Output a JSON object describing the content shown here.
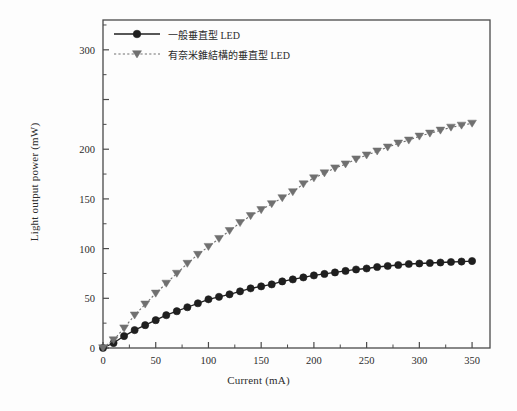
{
  "chart_data": {
    "type": "line",
    "title": "",
    "xlabel": "Current (mA)",
    "ylabel": "Light output power (mW)",
    "xlim": [
      0,
      367
    ],
    "ylim": [
      0,
      330
    ],
    "xticks": [
      0,
      50,
      100,
      150,
      200,
      250,
      300,
      350
    ],
    "xtick_labels": [
      "0",
      "50",
      "100",
      "150",
      "200",
      "250",
      "300",
      "350"
    ],
    "xminor_step": 25,
    "yticks": [
      0,
      50,
      100,
      150,
      200,
      250,
      300
    ],
    "ytick_labels": [
      "0",
      "50",
      "100",
      "150",
      "200",
      "",
      "300"
    ],
    "yminor_step": 25,
    "grid": false,
    "legend_position": "top-left",
    "x": [
      0,
      10,
      20,
      30,
      40,
      50,
      60,
      70,
      80,
      90,
      100,
      110,
      120,
      130,
      140,
      150,
      160,
      170,
      180,
      190,
      200,
      210,
      220,
      230,
      240,
      250,
      260,
      270,
      280,
      290,
      300,
      310,
      320,
      330,
      340,
      350
    ],
    "series": [
      {
        "name": "一般垂直型 LED",
        "marker": "circle",
        "line_style": "solid",
        "color": "#1f1f1f",
        "values": [
          0,
          5,
          12,
          18,
          23,
          28,
          33,
          37,
          41,
          45,
          49,
          51.5,
          54,
          57,
          60,
          62,
          64,
          67,
          69,
          71,
          73,
          74.5,
          76,
          77.5,
          79,
          80,
          81.5,
          82.5,
          83.5,
          84.5,
          85,
          85.5,
          86,
          86.5,
          87,
          87.5
        ]
      },
      {
        "name": "有奈米錐結構的垂直型 LED",
        "marker": "triangle-down",
        "line_style": "dotted",
        "color": "#707070",
        "values": [
          0,
          8,
          20,
          33,
          44,
          55,
          65,
          75,
          85,
          94,
          102,
          110,
          118,
          126,
          133,
          139,
          145,
          151,
          157,
          165,
          171,
          176,
          181,
          185,
          190,
          194,
          198,
          202,
          206,
          209,
          213,
          216,
          219,
          222,
          224,
          226
        ]
      }
    ]
  },
  "legend": {
    "entries": [
      {
        "label": "一般垂直型 LED",
        "marker": "circle-marker",
        "swatch": "solid-line-swatch"
      },
      {
        "label": "有奈米錐結構的垂直型 LED",
        "marker": "triangle-down-marker",
        "swatch": "dotted-line-swatch"
      }
    ]
  },
  "colors": {
    "series_1": "#1f1f1f",
    "series_2": "#707070",
    "axis": "#4a4a4a",
    "text": "#2b2b2b",
    "background": "#fdfdfd"
  }
}
